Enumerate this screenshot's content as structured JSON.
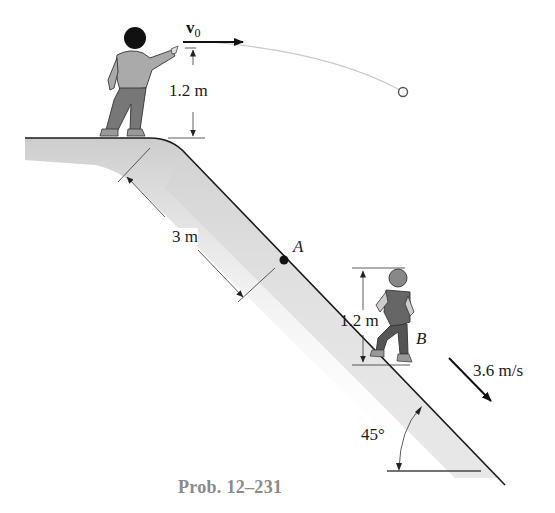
{
  "figure": {
    "caption": "Prob. 12–231",
    "labels": {
      "v0_symbol": "v",
      "v0_subscript": "0",
      "thrower_height": "1.2 m",
      "slope_distance": "3 m",
      "point_a": "A",
      "runner_height": "1.2 m",
      "point_b": "B",
      "runner_speed": "3.6 m/s",
      "slope_angle": "45°"
    },
    "elements": {
      "thrower": "boy standing on top of slope throwing ball",
      "runner": "boy running down slope at B",
      "ball": "ball on parabolic trajectory",
      "slope": "45-degree incline"
    },
    "colors": {
      "ink": "#1a1a1a",
      "caption": "#8a8a8a",
      "shading": "#cfcfcf",
      "trajectory": "#c8c8c8"
    }
  }
}
